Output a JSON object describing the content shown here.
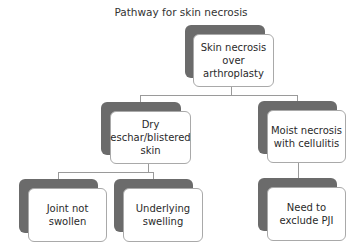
{
  "title": "Pathway for skin necrosis",
  "nodes": {
    "root": "Skin necrosis over arthroplasty",
    "left": "Dry eschar/blistered skin",
    "right": "Moist necrosis with cellulitis",
    "left_child_1": "Joint not swollen",
    "left_child_2": "Underlying swelling",
    "right_child": "Need to exclude PJI"
  },
  "edges": [
    [
      "root",
      "left"
    ],
    [
      "root",
      "right"
    ],
    [
      "left",
      "left_child_1"
    ],
    [
      "left",
      "left_child_2"
    ],
    [
      "right",
      "right_child"
    ]
  ],
  "colors": {
    "shadow": "#6b6b6b",
    "border": "#a9a9a9",
    "connector": "#9a9a9a"
  }
}
